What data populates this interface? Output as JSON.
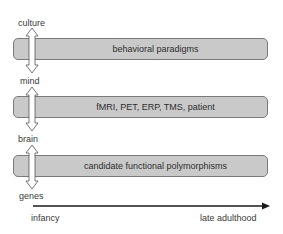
{
  "diagram": {
    "levels": [
      {
        "label": "culture"
      },
      {
        "label": "mind"
      },
      {
        "label": "brain"
      },
      {
        "label": "genes"
      }
    ],
    "boxes": [
      {
        "text": "behavioral paradigms"
      },
      {
        "text": "fMRI, PET, ERP, TMS, patient"
      },
      {
        "text": "candidate functional polymorphisms"
      }
    ],
    "timeline": {
      "start_label": "infancy",
      "end_label": "late adulthood"
    },
    "colors": {
      "box_fill": "#c9c9c9",
      "box_border": "#7a7a7a",
      "arrow_line": "#1a1a1a"
    }
  }
}
